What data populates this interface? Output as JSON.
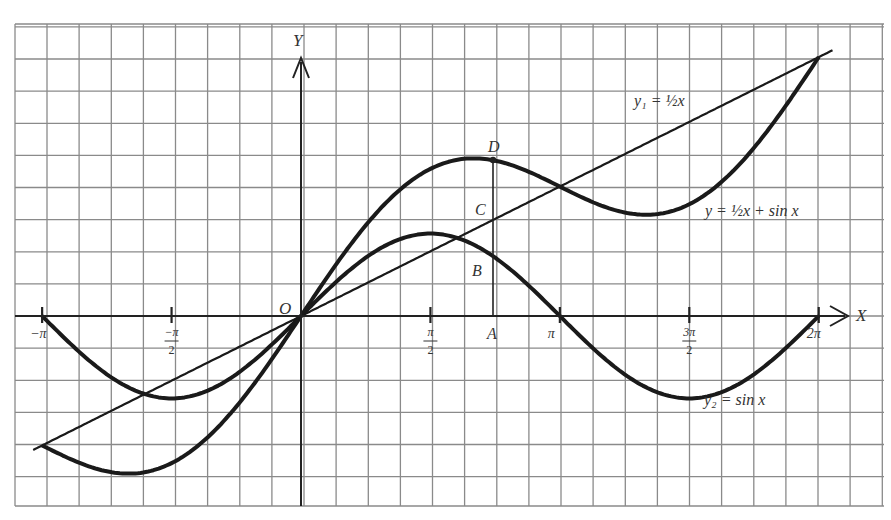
{
  "figure": {
    "axes": {
      "x_label": "X",
      "y_label": "Y",
      "origin_label": "O"
    },
    "x_ticks": [
      {
        "value": -3.14159,
        "label_num": "−π",
        "label_den": ""
      },
      {
        "value": -1.5708,
        "label_num": "−π",
        "label_den": "2"
      },
      {
        "value": 1.5708,
        "label_num": "π",
        "label_den": "2"
      },
      {
        "value": 3.14159,
        "label_num": "π",
        "label_den": ""
      },
      {
        "value": 4.71239,
        "label_num": "3π",
        "label_den": "2"
      },
      {
        "value": 6.28319,
        "label_num": "2π",
        "label_den": ""
      }
    ],
    "points": {
      "A": "A",
      "B": "B",
      "C": "C",
      "D": "D"
    },
    "curve_labels": {
      "line": "y₁ = ½x",
      "sum": "y = ½x + sin x",
      "sine": "y₂ = sin x"
    }
  },
  "chart_data": {
    "type": "line",
    "title": "",
    "xlabel": "X",
    "ylabel": "Y",
    "xlim": [
      -3.14159,
      6.28319
    ],
    "ylim": [
      -2.3,
      3.5
    ],
    "grid": true,
    "series": [
      {
        "name": "y1 = 1/2 x",
        "expr": "0.5*x",
        "x": [
          -3.14159,
          0,
          3.14159,
          6.28319
        ],
        "values": [
          -1.571,
          0,
          1.571,
          3.142
        ]
      },
      {
        "name": "y2 = sin x",
        "expr": "sin(x)",
        "x": [
          -3.14159,
          -1.5708,
          0,
          1.5708,
          3.14159,
          4.71239,
          6.28319
        ],
        "values": [
          0,
          -1,
          0,
          1,
          0,
          -1,
          0
        ]
      },
      {
        "name": "y = 1/2 x + sin x",
        "expr": "0.5*x+sin(x)",
        "x": [
          -3.14159,
          -2.094,
          0,
          2.094,
          3.14159,
          4.189,
          6.28319
        ],
        "values": [
          -1.571,
          -1.913,
          0,
          1.913,
          1.571,
          1.228,
          3.142
        ]
      }
    ],
    "annotations": [
      {
        "label": "A",
        "x": 2.33,
        "y": 0
      },
      {
        "label": "B",
        "x": 2.33,
        "y": 0.725
      },
      {
        "label": "C",
        "x": 2.33,
        "y": 1.165
      },
      {
        "label": "D",
        "x": 2.33,
        "y": 1.89
      }
    ]
  }
}
